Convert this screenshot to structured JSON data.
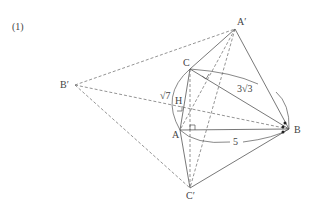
{
  "problem_number": "(1)",
  "points": {
    "A_prime": {
      "label": "A′",
      "x": 235,
      "y": 29
    },
    "C": {
      "label": "C",
      "x": 190,
      "y": 69
    },
    "B_prime": {
      "label": "B′",
      "x": 75,
      "y": 85
    },
    "H": {
      "label": "H",
      "x": 178,
      "y": 106
    },
    "A": {
      "label": "A",
      "x": 180,
      "y": 130
    },
    "B": {
      "label": "B",
      "x": 289,
      "y": 129
    },
    "C_prime": {
      "label": "C′",
      "x": 190,
      "y": 188
    }
  },
  "measurements": {
    "CB": "3√3",
    "AB": "5",
    "CA": "√7"
  },
  "colors": {
    "line": "#555555",
    "label": "#444444"
  }
}
